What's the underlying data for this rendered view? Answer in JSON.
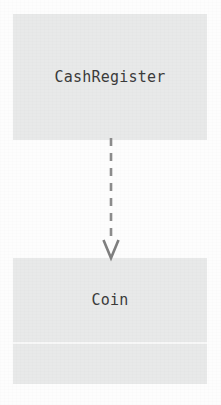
{
  "diagram": {
    "type": "uml-class-diagram",
    "background_color": "#fdfdfd",
    "classes": [
      {
        "id": "cashregister",
        "name": "CashRegister",
        "fill_color": "#e8e9e9",
        "text_color": "#3b3b3b",
        "compartments": 1,
        "has_divider": false
      },
      {
        "id": "coin",
        "name": "Coin",
        "fill_color": "#e8e9e9",
        "text_color": "#3b3b3b",
        "compartments": 2,
        "has_divider": true
      }
    ],
    "relationships": [
      {
        "id": "cashregister-depends-on-coin",
        "kind": "dependency",
        "from": "CashRegister",
        "to": "Coin",
        "line_style": "dashed",
        "arrowhead": "open-v",
        "direction": "down",
        "stroke_color": "#8c8c8c",
        "label": ""
      }
    ]
  }
}
